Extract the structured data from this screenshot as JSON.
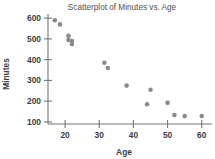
{
  "chart_data": {
    "type": "scatter",
    "title": "Scatterplot of Minutes vs. Age",
    "xlabel": "Age",
    "ylabel": "Minutes",
    "xlim": [
      15,
      63
    ],
    "ylim": [
      90,
      620
    ],
    "xticks": [
      20,
      30,
      40,
      50,
      60
    ],
    "yticks": [
      100,
      200,
      300,
      400,
      500,
      600
    ],
    "grid": false,
    "legend": null,
    "point_color": "#8a8a8a",
    "series": [
      {
        "name": "Minutes vs. Age",
        "x": [
          17,
          18.5,
          21,
          21,
          22,
          22,
          31.5,
          32.5,
          38,
          44,
          45,
          50,
          52,
          55,
          60
        ],
        "y": [
          590,
          570,
          515,
          495,
          490,
          475,
          385,
          360,
          275,
          185,
          255,
          192,
          133,
          128,
          128
        ]
      }
    ]
  },
  "axis": {
    "x_tick_labels": [
      "20",
      "30",
      "40",
      "50",
      "60"
    ],
    "y_tick_labels": [
      "100",
      "200",
      "300",
      "400",
      "500",
      "600"
    ]
  }
}
